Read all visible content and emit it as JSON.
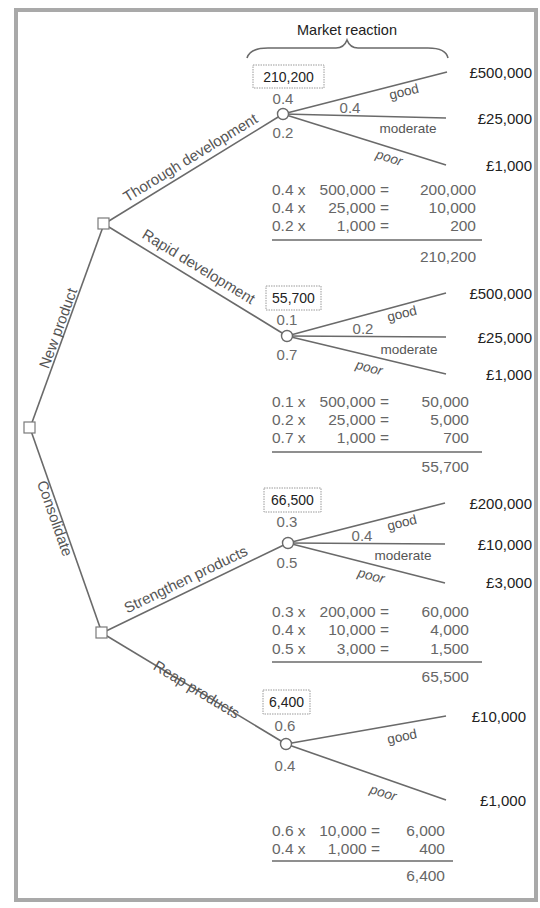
{
  "diagram": {
    "type": "decision-tree",
    "header": "Market reaction",
    "root": {
      "branches": [
        {
          "label": "New product"
        },
        {
          "label": "Consolidate"
        }
      ]
    },
    "decisions": [
      {
        "label": "Thorough development",
        "ev": "210,200",
        "outcomes": [
          {
            "name": "good",
            "prob": "0.4",
            "payoff": "£500,000"
          },
          {
            "name": "moderate",
            "prob": "0.4",
            "payoff": "£25,000"
          },
          {
            "name": "poor",
            "prob": "0.2",
            "payoff": "£1,000"
          }
        ],
        "calc": [
          {
            "p": "0.4 x",
            "v": "500,000 =",
            "r": "200,000"
          },
          {
            "p": "0.4 x",
            "v": "25,000 =",
            "r": "10,000"
          },
          {
            "p": "0.2 x",
            "v": "1,000 =",
            "r": "200"
          }
        ],
        "total": "210,200"
      },
      {
        "label": "Rapid development",
        "ev": "55,700",
        "outcomes": [
          {
            "name": "good",
            "prob": "0.1",
            "payoff": "£500,000"
          },
          {
            "name": "moderate",
            "prob": "0.2",
            "payoff": "£25,000"
          },
          {
            "name": "poor",
            "prob": "0.7",
            "payoff": "£1,000"
          }
        ],
        "calc": [
          {
            "p": "0.1 x",
            "v": "500,000 =",
            "r": "50,000"
          },
          {
            "p": "0.2 x",
            "v": "25,000 =",
            "r": "5,000"
          },
          {
            "p": "0.7 x",
            "v": "1,000 =",
            "r": "700"
          }
        ],
        "total": "55,700"
      },
      {
        "label": "Strengthen products",
        "ev": "66,500",
        "outcomes": [
          {
            "name": "good",
            "prob": "0.3",
            "payoff": "£200,000"
          },
          {
            "name": "moderate",
            "prob": "0.4",
            "payoff": "£10,000"
          },
          {
            "name": "poor",
            "prob": "0.5",
            "payoff": "£3,000"
          }
        ],
        "calc": [
          {
            "p": "0.3 x",
            "v": "200,000 =",
            "r": "60,000"
          },
          {
            "p": "0.4 x",
            "v": "10,000 =",
            "r": "4,000"
          },
          {
            "p": "0.5 x",
            "v": "3,000 =",
            "r": "1,500"
          }
        ],
        "total": "65,500"
      },
      {
        "label": "Reap products",
        "ev": "6,400",
        "outcomes": [
          {
            "name": "good",
            "prob": "0.6",
            "payoff": "£10,000"
          },
          {
            "name": "poor",
            "prob": "0.4",
            "payoff": "£1,000"
          }
        ],
        "calc": [
          {
            "p": "0.6 x",
            "v": "10,000 =",
            "r": "6,000"
          },
          {
            "p": "0.4 x",
            "v": "1,000 =",
            "r": "400"
          }
        ],
        "total": "6,400"
      }
    ],
    "colors": {
      "line": "#6a6a6a",
      "frame": "#a9a9a9",
      "text": "#222222",
      "muted": "#666666"
    }
  }
}
